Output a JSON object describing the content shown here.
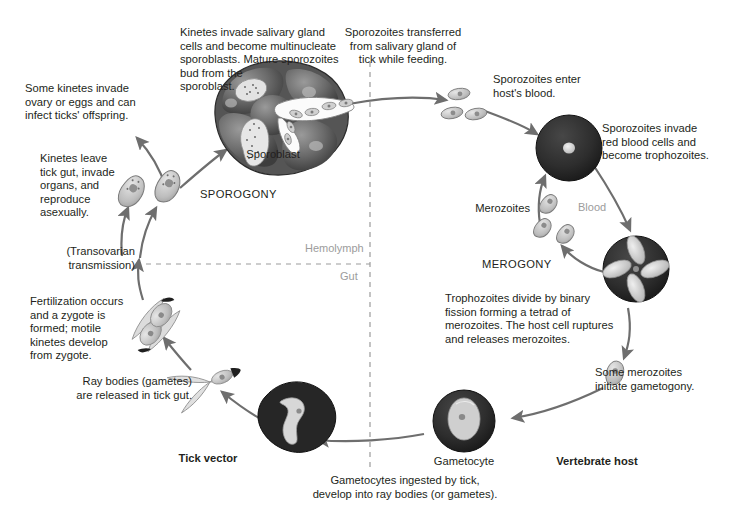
{
  "diagram": {
    "compartments": {
      "hemolymph": "Hemolymph",
      "gut": "Gut",
      "blood": "Blood"
    },
    "hosts": {
      "tick": "Tick vector",
      "vertebrate": "Vertebrate host"
    },
    "phases": {
      "sporogony": "SPOROGONY",
      "merogony": "MEROGONY"
    },
    "structure_labels": {
      "sporoblast": "Sporoblast",
      "merozoites": "Merozoites",
      "gametocyte": "Gametocyte"
    },
    "captions": {
      "kinetes_salivary": "Kinetes invade salivary gland\ncells and become multinucleate\nsporoblasts. Mature sporozoites\nbud from the\nsporoblast.",
      "sporozoites_transferred": "Sporozoites transferred\nfrom salivary gland of\ntick while feeding.",
      "sporozoites_enter": "Sporozoites enter\nhost's blood.",
      "sporozoites_invade": "Sporozoites invade\nred blood cells and\nbecome trophozoites.",
      "trophozoites_divide": "Trophozoites divide by binary\nfission forming a tetrad of\nmerozoites. The host cell ruptures\nand releases merozoites.",
      "some_merozoites": "Some merozoites\ninitiate gametogony.",
      "gametocytes_ingested": "Gametocytes ingested by tick,\ndevelop into ray bodies (or gametes).",
      "ray_bodies": "Ray bodies (gametes)\nare released in tick gut.",
      "fertilization": "Fertilization occurs\nand a zygote is\nformed; motile\nkinetes develop\nfrom zygote.",
      "transovarian": "(Transovarian\ntransmission)",
      "kinetes_leave": "Kinetes leave\ntick gut, invade\norgans, and\nreproduce\nasexually.",
      "some_kinetes": "Some kinetes invade\novary or eggs and can\ninfect ticks' offspring."
    },
    "colors": {
      "text": "#231f20",
      "muted": "#9c9c9c",
      "arrow": "#6e6e6e",
      "cell_dark": "#2a2a2a",
      "cell_light": "#d6d6d6",
      "background": "#ffffff"
    }
  }
}
